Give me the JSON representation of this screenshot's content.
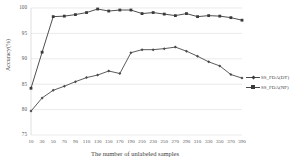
{
  "chart_data": {
    "type": "line",
    "title": "",
    "xlabel": "The number of unlabeled samples",
    "ylabel": "Accuracy(%)",
    "ylim": [
      75,
      100
    ],
    "yticks": [
      100,
      95,
      90,
      85,
      80,
      75
    ],
    "grid": true,
    "legend_position": "right",
    "categories": [
      "10",
      "30",
      "50",
      "70",
      "90",
      "110",
      "130",
      "150",
      "170",
      "190",
      "210",
      "230",
      "250",
      "270",
      "290",
      "310",
      "330",
      "350",
      "370",
      "390"
    ],
    "series": [
      {
        "name": "SS_FDA(DT)",
        "marker": "diamond",
        "color": "#4a4a4a",
        "values": [
          79.7,
          82.3,
          83.8,
          84.6,
          85.5,
          86.3,
          86.8,
          87.6,
          87.1,
          91.2,
          91.8,
          91.8,
          92.0,
          92.3,
          91.5,
          90.5,
          89.4,
          88.6,
          86.9,
          86.2
        ]
      },
      {
        "name": "SS_FDA(NF)",
        "marker": "square",
        "color": "#3a3a3a",
        "values": [
          84.2,
          91.3,
          98.3,
          98.4,
          98.7,
          99.1,
          99.8,
          99.4,
          99.6,
          99.6,
          98.9,
          99.1,
          98.8,
          98.5,
          98.9,
          98.3,
          98.5,
          98.4,
          98.1,
          97.6
        ]
      }
    ]
  },
  "legend": {
    "items": [
      {
        "label": "SS_FDA(DT)"
      },
      {
        "label": "SS_FDA(NF)"
      }
    ]
  }
}
